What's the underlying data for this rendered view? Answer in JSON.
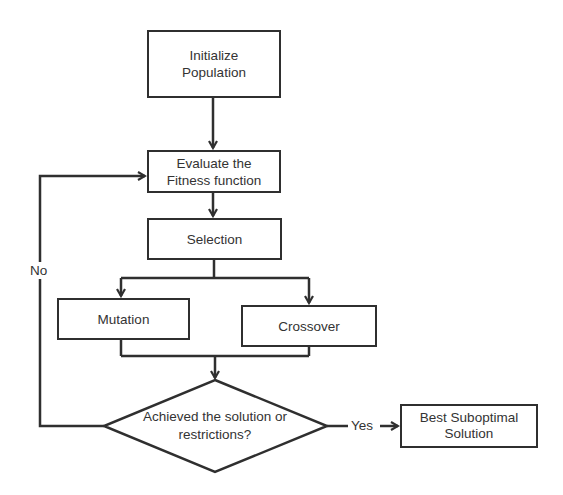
{
  "diagram": {
    "type": "flowchart",
    "nodes": {
      "initialize": {
        "line1": "Initialize",
        "line2": "Population"
      },
      "evaluate": {
        "line1": "Evaluate the",
        "line2": "Fitness function"
      },
      "selection": {
        "label": "Selection"
      },
      "mutation": {
        "label": "Mutation"
      },
      "crossover": {
        "label": "Crossover"
      },
      "decision": {
        "line1": "Achieved the solution or",
        "line2": "restrictions?"
      },
      "best": {
        "line1": "Best Suboptimal",
        "line2": "Solution"
      }
    },
    "edges": {
      "no_label": "No",
      "yes_label": "Yes"
    },
    "colors": {
      "stroke": "#2f2f2f",
      "background": "#ffffff",
      "text": "#333333"
    }
  }
}
